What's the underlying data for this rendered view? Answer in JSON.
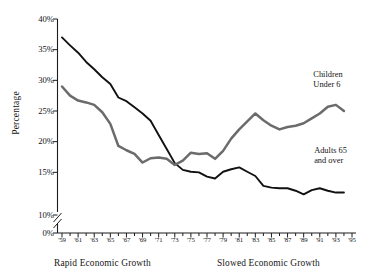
{
  "chart_data": {
    "type": "line",
    "title": "",
    "subtitle": "",
    "xlabel": "",
    "ylabel": "Percentage",
    "xlim": [
      1959,
      1995
    ],
    "ylim": [
      0,
      40
    ],
    "y_axis_break": true,
    "y_break_between": [
      0,
      10
    ],
    "grid": false,
    "legend_position": "inline-right",
    "ytick_labels": [
      "0%",
      "10%",
      "15%",
      "20%",
      "25%",
      "30%",
      "35%",
      "40%"
    ],
    "ytick_values": [
      0,
      10,
      15,
      20,
      25,
      30,
      35,
      40
    ],
    "xtick_labels": [
      "'59",
      "'61",
      "'63",
      "'65",
      "'67",
      "'69",
      "'71",
      "'73",
      "'75",
      "'77",
      "'79",
      "'81",
      "'83",
      "'85",
      "'87",
      "'89",
      "'91",
      "'93",
      "'95"
    ],
    "xtick_values": [
      1959,
      1961,
      1963,
      1965,
      1967,
      1969,
      1971,
      1973,
      1975,
      1977,
      1979,
      1981,
      1983,
      1985,
      1987,
      1989,
      1991,
      1993,
      1995
    ],
    "minor_xticks_every": 1,
    "x": [
      1959,
      1960,
      1961,
      1962,
      1963,
      1964,
      1965,
      1966,
      1967,
      1968,
      1969,
      1970,
      1971,
      1972,
      1973,
      1974,
      1975,
      1976,
      1977,
      1978,
      1979,
      1980,
      1981,
      1982,
      1983,
      1984,
      1985,
      1986,
      1987,
      1988,
      1989,
      1990,
      1991,
      1992,
      1993,
      1994
    ],
    "series": [
      {
        "name": "Adults 65 and over",
        "color": "#111111",
        "label_lines": [
          "Adults 65",
          "and over"
        ],
        "label_x": 1990.3,
        "label_y_pct": 17.4,
        "values": [
          37.0,
          35.7,
          34.5,
          33.0,
          31.8,
          30.5,
          29.4,
          27.2,
          26.6,
          25.6,
          24.6,
          23.4,
          21.1,
          18.8,
          16.5,
          15.4,
          15.1,
          15.0,
          14.3,
          14.0,
          15.1,
          15.5,
          15.8,
          15.1,
          14.4,
          12.8,
          12.5,
          12.4,
          12.4,
          12.0,
          11.4,
          12.1,
          12.4,
          12.0,
          11.7,
          11.7
        ]
      },
      {
        "name": "Children Under 6",
        "color": "#6b6b6b",
        "label_lines": [
          "Children",
          "Under 6"
        ],
        "label_x": 1990.2,
        "label_y_pct": 29.8,
        "values": [
          29.0,
          27.5,
          26.7,
          26.4,
          26.0,
          24.8,
          22.9,
          19.3,
          18.6,
          18.0,
          16.6,
          17.3,
          17.4,
          17.2,
          16.2,
          16.9,
          18.2,
          18.0,
          18.1,
          17.2,
          18.5,
          20.5,
          22.0,
          23.3,
          24.6,
          23.5,
          22.6,
          22.0,
          22.4,
          22.6,
          23.0,
          23.8,
          24.6,
          25.7,
          26.0,
          25.0
        ]
      }
    ],
    "annotations": [
      {
        "name": "rapid-economic-growth",
        "text": "Rapid Economic Growth",
        "x_px": 54,
        "align": "left"
      },
      {
        "name": "slowed-economic-growth",
        "text": "Slowed Economic Growth",
        "x_px": 217,
        "align": "left"
      }
    ]
  }
}
